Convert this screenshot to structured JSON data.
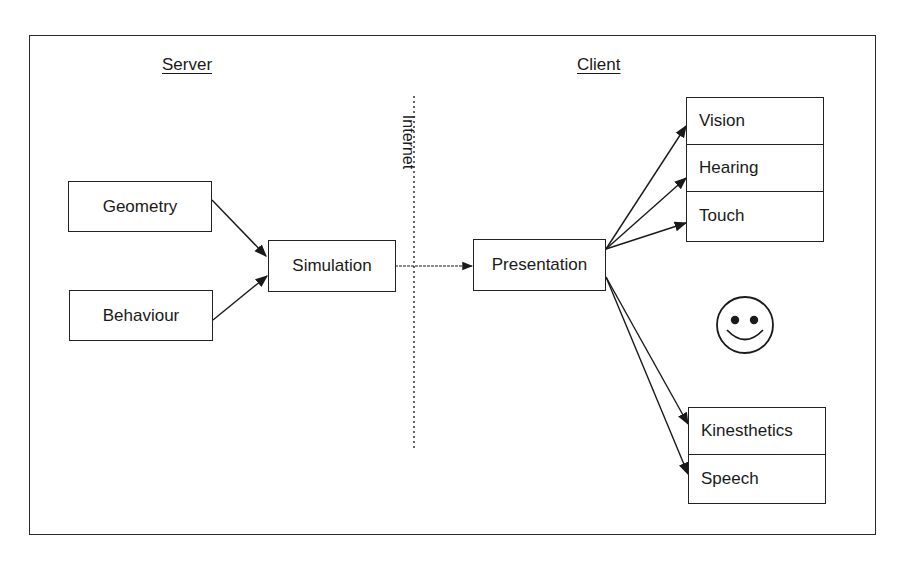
{
  "diagram": {
    "headings": {
      "server": "Server",
      "client": "Client"
    },
    "divider_label": "Internet",
    "server_nodes": {
      "geometry": "Geometry",
      "behaviour": "Behaviour",
      "simulation": "Simulation"
    },
    "client_nodes": {
      "presentation": "Presentation",
      "senses_top": [
        "Vision",
        "Hearing",
        "Touch"
      ],
      "senses_bottom": [
        "Kinesthetics",
        "Speech"
      ]
    },
    "user_icon": "smiley-face-icon",
    "edges": [
      {
        "from": "Geometry",
        "to": "Simulation"
      },
      {
        "from": "Behaviour",
        "to": "Simulation"
      },
      {
        "from": "Simulation",
        "to": "Presentation",
        "style": "crosses-internet"
      },
      {
        "from": "Presentation",
        "to": "Vision"
      },
      {
        "from": "Presentation",
        "to": "Hearing"
      },
      {
        "from": "Presentation",
        "to": "Touch"
      },
      {
        "from": "Presentation",
        "to": "Kinesthetics"
      },
      {
        "from": "Presentation",
        "to": "Speech"
      }
    ]
  }
}
